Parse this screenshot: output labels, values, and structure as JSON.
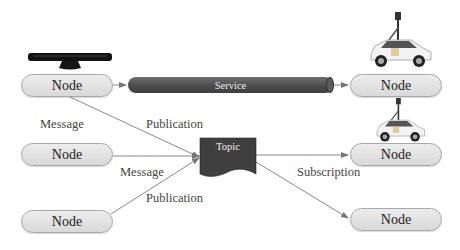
{
  "diagram": {
    "type": "ros-communication",
    "colors": {
      "node_fill": "#e2e2e2",
      "node_border": "#a9a9a9",
      "service_fill": "#4f4f4f",
      "topic_fill": "#3f3f3f",
      "arrow": "#777777",
      "label_text": "#444444"
    },
    "left_nodes": [
      {
        "label": "Node"
      },
      {
        "label": "Node"
      },
      {
        "label": "Node"
      }
    ],
    "right_nodes": [
      {
        "label": "Node"
      },
      {
        "label": "Node"
      },
      {
        "label": "Node"
      }
    ],
    "service": {
      "label": "Service"
    },
    "topic": {
      "label": "Topic"
    },
    "edge_labels": {
      "message_1": "Message",
      "publication_1": "Publication",
      "message_2": "Message",
      "publication_2": "Publication",
      "subscription": "Subscription"
    },
    "images": {
      "sensor": "kinect-sensor",
      "car_1": "street-view-car",
      "car_2": "street-view-car"
    }
  }
}
